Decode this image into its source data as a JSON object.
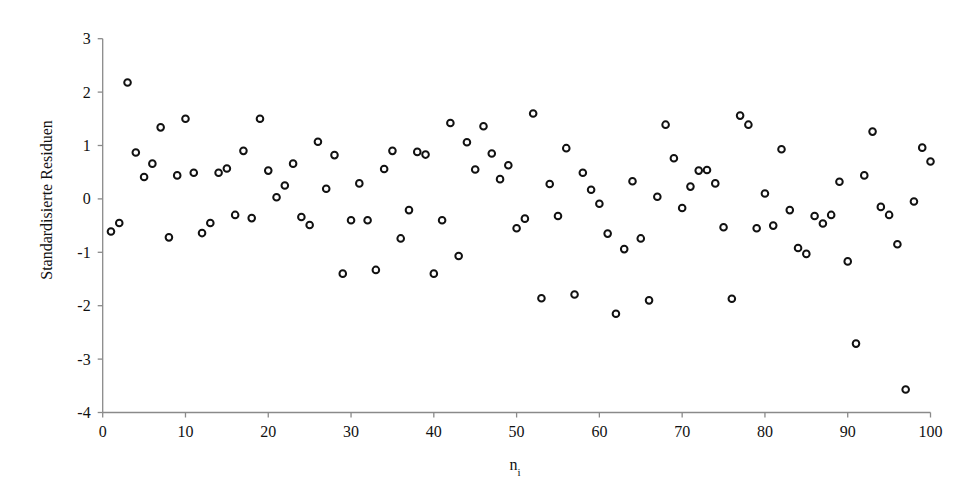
{
  "chart_data": {
    "type": "scatter",
    "title": "",
    "xlabel": "n",
    "xlabel_subscript": "i",
    "ylabel": "Standardisierte Residuen",
    "xlim": [
      0,
      100
    ],
    "ylim": [
      -4,
      3
    ],
    "grid": false,
    "legend": null,
    "x_ticks": [
      0,
      10,
      20,
      30,
      40,
      50,
      60,
      70,
      80,
      90,
      100
    ],
    "y_ticks": [
      3,
      2,
      1,
      0,
      -1,
      -2,
      -3,
      -4
    ],
    "marker": "open-circle",
    "series": [
      {
        "name": "Standardisierte Residuen",
        "x": [
          1,
          2,
          3,
          4,
          5,
          6,
          7,
          8,
          9,
          10,
          11,
          12,
          13,
          14,
          15,
          16,
          17,
          18,
          19,
          20,
          21,
          22,
          23,
          24,
          25,
          26,
          27,
          28,
          29,
          30,
          31,
          32,
          33,
          34,
          35,
          36,
          37,
          38,
          39,
          40,
          41,
          42,
          43,
          44,
          45,
          46,
          47,
          48,
          49,
          50,
          51,
          52,
          53,
          54,
          55,
          56,
          57,
          58,
          59,
          60,
          61,
          62,
          63,
          64,
          65,
          66,
          67,
          68,
          69,
          70,
          71,
          72,
          73,
          74,
          75,
          76,
          77,
          78,
          79,
          80,
          81,
          82,
          83,
          84,
          85,
          86,
          87,
          88,
          89,
          90,
          91,
          92,
          93,
          94,
          95,
          96,
          97,
          98,
          99,
          100
        ],
        "y": [
          -0.61,
          -0.45,
          2.18,
          0.87,
          0.41,
          0.66,
          1.34,
          -0.72,
          0.44,
          1.5,
          0.49,
          -0.64,
          -0.45,
          0.49,
          0.57,
          -0.3,
          0.9,
          -0.36,
          1.5,
          0.53,
          0.03,
          0.25,
          0.66,
          -0.34,
          -0.49,
          1.07,
          0.19,
          0.82,
          -1.4,
          -0.4,
          0.29,
          -0.4,
          -1.33,
          0.56,
          0.9,
          -0.74,
          -0.21,
          0.88,
          0.83,
          -1.4,
          -0.4,
          1.42,
          -1.07,
          1.06,
          0.55,
          1.36,
          0.85,
          0.37,
          0.63,
          -0.55,
          -0.37,
          1.6,
          -1.86,
          0.28,
          -0.32,
          0.95,
          -1.79,
          0.49,
          0.17,
          -0.09,
          -0.65,
          -2.15,
          -0.94,
          0.33,
          -0.74,
          -1.9,
          0.04,
          1.39,
          0.76,
          -0.17,
          0.23,
          0.53,
          0.54,
          0.29,
          -0.53,
          -1.87,
          1.56,
          1.39,
          -0.55,
          0.1,
          -0.5,
          0.93,
          -0.21,
          -0.92,
          -1.03,
          -0.32,
          -0.46,
          -0.3,
          0.32,
          -1.17,
          -2.71,
          0.44,
          1.26,
          -0.15,
          -0.3,
          -0.85,
          -3.57,
          -0.05,
          0.96,
          0.7
        ]
      }
    ]
  },
  "colors": {
    "axis": "#8a8a8a",
    "marker": "#111111",
    "background": "#ffffff"
  }
}
